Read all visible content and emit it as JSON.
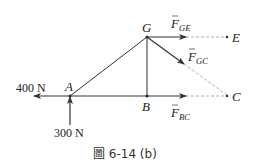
{
  "figure": {
    "caption": "圖 6-14 (b)",
    "caption_prefix": "圖",
    "caption_number": "6-14",
    "caption_part": "(b)"
  },
  "nodes": {
    "A": {
      "label": "A"
    },
    "B": {
      "label": "B"
    },
    "C": {
      "label": "C"
    },
    "E": {
      "label": "E"
    },
    "G": {
      "label": "G"
    }
  },
  "members": [
    "AG",
    "AB",
    "GB"
  ],
  "forces": {
    "external": [
      {
        "name": "horizontal-load",
        "value": "400 N",
        "direction": "left",
        "at": "A"
      },
      {
        "name": "vertical-reaction",
        "value": "300 N",
        "direction": "up",
        "at": "A"
      }
    ],
    "internal": [
      {
        "name": "F_GE",
        "symbol": "F",
        "subscript": "GE",
        "from": "G",
        "toward": "E"
      },
      {
        "name": "F_GC",
        "symbol": "F",
        "subscript": "GC",
        "from": "G",
        "toward": "C"
      },
      {
        "name": "F_BC",
        "symbol": "F",
        "subscript": "BC",
        "from": "B",
        "toward": "C"
      }
    ]
  },
  "colors": {
    "line": "#333333",
    "dashed": "#999999",
    "text": "#222222"
  }
}
